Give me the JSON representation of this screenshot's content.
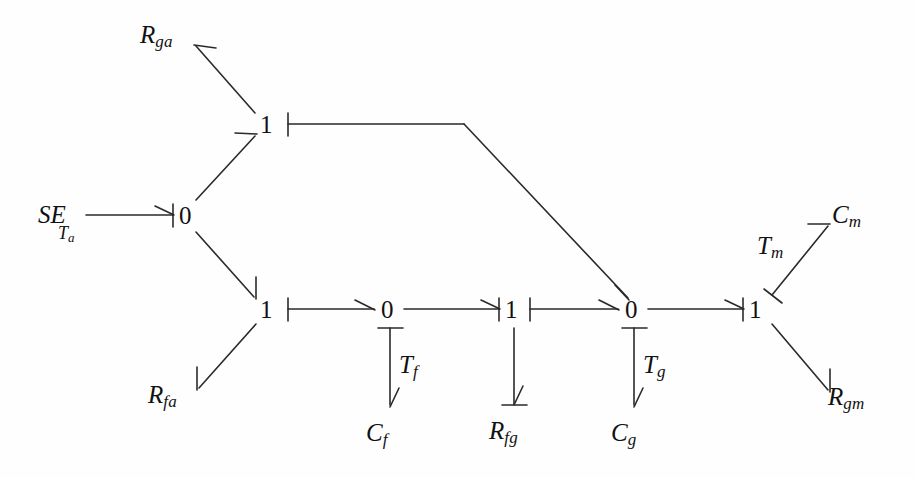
{
  "figure": {
    "kind": "bond-graph",
    "title": "",
    "background": "#fefefe",
    "stroke_color": "#2a2a2a",
    "text_color": "#111111"
  },
  "source": {
    "label": "SE",
    "subscript": "Ta",
    "sub_main": "T",
    "sub_sub": "a"
  },
  "junctions": [
    {
      "id": "j1a",
      "label": "1",
      "x": 267,
      "y": 125
    },
    {
      "id": "j0a",
      "label": "0",
      "x": 186,
      "y": 216
    },
    {
      "id": "j1f",
      "label": "1",
      "x": 267,
      "y": 310
    },
    {
      "id": "j0f",
      "label": "0",
      "x": 388,
      "y": 310
    },
    {
      "id": "j1fg",
      "label": "1",
      "x": 512,
      "y": 310
    },
    {
      "id": "j0g",
      "label": "0",
      "x": 632,
      "y": 310
    },
    {
      "id": "j1m",
      "label": "1",
      "x": 756,
      "y": 310
    }
  ],
  "elements": [
    {
      "id": "Rga",
      "main": "R",
      "sub": "ga",
      "x": 140,
      "y": 22
    },
    {
      "id": "Rfa",
      "main": "R",
      "sub": "fa",
      "x": 148,
      "y": 382
    },
    {
      "id": "Tf",
      "main": "T",
      "sub": "f",
      "x": 399,
      "y": 352
    },
    {
      "id": "Cf",
      "main": "C",
      "sub": "f",
      "x": 366,
      "y": 420
    },
    {
      "id": "Rfg",
      "main": "R",
      "sub": "fg",
      "x": 489,
      "y": 418
    },
    {
      "id": "Tg",
      "main": "T",
      "sub": "g",
      "x": 643,
      "y": 352
    },
    {
      "id": "Cg",
      "main": "C",
      "sub": "g",
      "x": 611,
      "y": 420
    },
    {
      "id": "Tm",
      "main": "T",
      "sub": "m",
      "x": 757,
      "y": 233
    },
    {
      "id": "Cm",
      "main": "C",
      "sub": "m",
      "x": 832,
      "y": 202
    },
    {
      "id": "Rgm",
      "main": "R",
      "sub": "gm",
      "x": 828,
      "y": 384
    }
  ],
  "bonds": [
    {
      "from": "SE",
      "to": "0 (Ta)",
      "direction": "right",
      "causality": "at-head"
    },
    {
      "from": "0 (Ta)",
      "to": "1 (top)",
      "direction": "up-right",
      "causality": "none"
    },
    {
      "from": "1 (top)",
      "to": "Rga",
      "direction": "up-left",
      "causality": "none"
    },
    {
      "from": "1 (top)",
      "to": "0 (Tg)",
      "direction": "right-then-down",
      "causality": "at-tail"
    },
    {
      "from": "0 (Ta)",
      "to": "1 (fa)",
      "direction": "down-right",
      "causality": "none"
    },
    {
      "from": "1 (fa)",
      "to": "Rfa",
      "direction": "down-left",
      "causality": "none"
    },
    {
      "from": "1 (fa)",
      "to": "0 (Tf)",
      "direction": "right",
      "causality": "at-tail"
    },
    {
      "from": "0 (Tf)",
      "to": "1 (fg)",
      "direction": "right",
      "causality": "at-head"
    },
    {
      "from": "0 (Tf)",
      "to": "Cf",
      "direction": "down",
      "causality": "at-tail"
    },
    {
      "from": "1 (fg)",
      "to": "0 (Tg)",
      "direction": "right",
      "causality": "at-tail"
    },
    {
      "from": "1 (fg)",
      "to": "Rfg",
      "direction": "down",
      "causality": "at-head"
    },
    {
      "from": "0 (Tg)",
      "to": "1 (Tm)",
      "direction": "right",
      "causality": "at-head"
    },
    {
      "from": "0 (Tg)",
      "to": "Cg",
      "direction": "down",
      "causality": "at-tail"
    },
    {
      "from": "1 (Tm)",
      "to": "Cm",
      "direction": "up-right",
      "causality": "at-tail"
    },
    {
      "from": "1 (Tm)",
      "to": "Rgm",
      "direction": "down-right",
      "causality": "none"
    }
  ]
}
